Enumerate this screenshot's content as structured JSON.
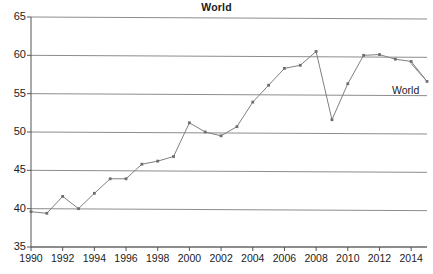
{
  "chart_data": {
    "type": "line",
    "title": "World",
    "xlabel": "",
    "ylabel": "",
    "grid": true,
    "legend_position": "inline-end-of-line",
    "series_label": "World",
    "x": [
      1990,
      1991,
      1992,
      1993,
      1994,
      1995,
      1996,
      1997,
      1998,
      1999,
      2000,
      2001,
      2002,
      2003,
      2004,
      2005,
      2006,
      2007,
      2008,
      2009,
      2010,
      2011,
      2012,
      2013,
      2014,
      2015
    ],
    "series": [
      {
        "name": "World",
        "values": [
          39.6,
          39.4,
          41.6,
          40.0,
          42.0,
          43.9,
          43.9,
          45.8,
          46.2,
          46.8,
          51.2,
          50.0,
          49.5,
          50.7,
          53.9,
          56.1,
          58.3,
          58.7,
          60.5,
          51.6,
          56.3,
          60.0,
          60.1,
          59.5,
          59.2,
          56.6
        ]
      }
    ],
    "xlim": [
      1990,
      2015
    ],
    "ylim": [
      35,
      65
    ],
    "y_ticks": [
      35,
      40,
      45,
      50,
      55,
      60,
      65
    ],
    "y_tick_labels": [
      "35",
      "40",
      "45",
      "50",
      "55",
      "60",
      "65"
    ],
    "x_ticks": [
      1990,
      1992,
      1994,
      1996,
      1998,
      2000,
      2002,
      2004,
      2006,
      2008,
      2010,
      2012,
      2014
    ],
    "x_tick_labels": [
      "1990",
      "1992",
      "1994",
      "1996",
      "1998",
      "2000",
      "2002",
      "2004",
      "2006",
      "2008",
      "2010",
      "2012",
      "2014"
    ],
    "colors": {
      "line": "#808080",
      "marker": "#6e6e6e",
      "grid": "#8c8c8c",
      "axis": "#555555",
      "text": "#1c1c1c",
      "background": "#ffffff"
    }
  }
}
